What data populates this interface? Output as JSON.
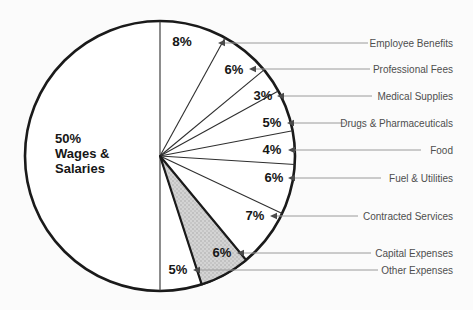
{
  "chart_data": {
    "type": "pie",
    "title": "",
    "start_angle": "top",
    "direction": "clockwise",
    "legend_position": "right, connected by leader lines with arrows",
    "units": "%",
    "slices": [
      {
        "label": "Employee Benefits",
        "pct_label": "8%",
        "value": 8,
        "shaded": false
      },
      {
        "label": "Professional Fees",
        "pct_label": "6%",
        "value": 6,
        "shaded": false
      },
      {
        "label": "Medical Supplies",
        "pct_label": "3%",
        "value": 3,
        "shaded": false
      },
      {
        "label": "Drugs & Pharmaceuticals",
        "pct_label": "5%",
        "value": 5,
        "shaded": false
      },
      {
        "label": "Food",
        "pct_label": "4%",
        "value": 4,
        "shaded": false
      },
      {
        "label": "Fuel & Utilities",
        "pct_label": "6%",
        "value": 6,
        "shaded": false
      },
      {
        "label": "Contracted Services",
        "pct_label": "7%",
        "value": 7,
        "shaded": false
      },
      {
        "label": "Capital Expenses",
        "pct_label": "6%",
        "value": 6,
        "shaded": true
      },
      {
        "label": "Other Expenses",
        "pct_label": "5%",
        "value": 5,
        "shaded": false
      },
      {
        "label": "Wages & Salaries",
        "pct_label": "50%",
        "value": 50,
        "shaded": false,
        "label_inside": true,
        "label_lines": [
          "50%",
          "Wages &",
          "Salaries"
        ]
      }
    ],
    "colors": {
      "ink": "#1a1a1a",
      "thin_line": "#2e2e2e",
      "leader": "#9a9a9a",
      "arrow": "#4a4a4a",
      "category_text": "#4e4e4e",
      "shaded_fill_avg": "#c9c9c9",
      "background": "#fbfbfb",
      "pie_fill": "#ffffff"
    },
    "layout": {
      "width": 473,
      "height": 310,
      "center": [
        160,
        156
      ],
      "radius": 135,
      "label_right_x": 453,
      "wages_label_pos": [
        55,
        143
      ],
      "wages_line_height": 15,
      "slices": [
        {
          "leader_y": 43,
          "arrow_x": 218,
          "line_end_x": 368,
          "pct_pos": [
            182,
            46
          ]
        },
        {
          "leader_y": 69,
          "arrow_x": 249,
          "line_end_x": 370,
          "pct_pos": [
            234,
            74
          ]
        },
        {
          "leader_y": 96,
          "arrow_x": 277,
          "line_end_x": 372,
          "pct_pos": [
            263,
            100
          ]
        },
        {
          "leader_y": 123,
          "arrow_x": 287,
          "line_end_x": 345,
          "pct_pos": [
            272,
            127
          ]
        },
        {
          "leader_y": 150,
          "arrow_x": 288,
          "line_end_x": 421,
          "pct_pos": [
            272,
            154
          ]
        },
        {
          "leader_y": 178,
          "arrow_x": 288,
          "line_end_x": 381,
          "pct_pos": [
            274,
            182
          ]
        },
        {
          "leader_y": 216,
          "arrow_x": 270,
          "line_end_x": 358,
          "pct_pos": [
            255,
            220
          ]
        },
        {
          "leader_y": 253,
          "arrow_x": 237,
          "line_end_x": 371,
          "pct_pos": [
            222,
            257
          ]
        },
        {
          "leader_y": 270,
          "arrow_x": 193,
          "line_end_x": 378,
          "pct_pos": [
            178,
            274
          ]
        }
      ]
    }
  }
}
